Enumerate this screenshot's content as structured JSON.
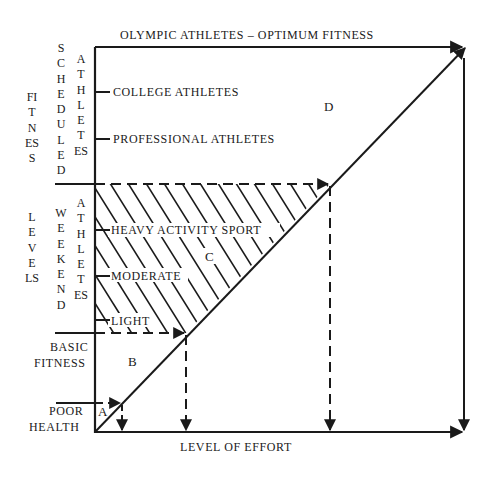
{
  "diagram": {
    "top_label": "OLYMPIC ATHLETES  –  OPTIMUM FITNESS",
    "x_axis_label": "LEVEL OF EFFORT",
    "y_axis_label_part1": "FITNESS",
    "y_axis_label_part2": "LEVELS",
    "scheduled_group": {
      "word1": "SCHEDULED",
      "word2": "ATHLETES"
    },
    "weekend_group": {
      "word1": "WEEKEND",
      "word2": "ATHLETES"
    },
    "levels": {
      "college": "COLLEGE ATHLETES",
      "professional": "PROFESSIONAL ATHLETES",
      "heavy": "HEAVY ACTIVITY SPORT",
      "moderate": "MODERATE",
      "light": "LIGHT",
      "basic_line1": "BASIC",
      "basic_line2": "FITNESS",
      "poor_line1": "POOR",
      "poor_line2": "HEALTH"
    },
    "regions": {
      "a": "A",
      "b": "B",
      "c": "C",
      "d": "D"
    },
    "colors": {
      "ink": "#1a1a1a",
      "background": "#ffffff"
    }
  }
}
